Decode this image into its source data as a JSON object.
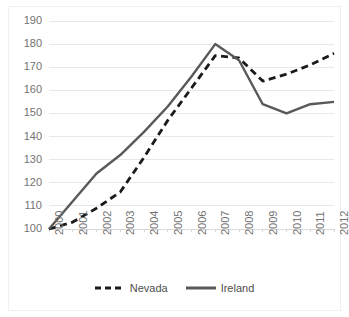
{
  "chart_data": {
    "type": "line",
    "title": "",
    "subtitle": "",
    "xlabel": "",
    "ylabel": "",
    "x": [
      2000,
      2001,
      2002,
      2003,
      2004,
      2005,
      2006,
      2007,
      2008,
      2009,
      2010,
      2011,
      2012
    ],
    "categories": [
      "2000",
      "2001",
      "2002",
      "2003",
      "2004",
      "2005",
      "2006",
      "2007",
      "2008",
      "2009",
      "2010",
      "2011",
      "2012"
    ],
    "series": [
      {
        "name": "Nevada",
        "style": "dashed",
        "color": "#1a1a1a",
        "values": [
          100,
          103,
          109,
          116,
          131,
          147,
          161,
          175,
          174,
          164,
          167,
          171,
          176
        ]
      },
      {
        "name": "Ireland",
        "style": "solid",
        "color": "#595959",
        "values": [
          100,
          112,
          124,
          132,
          142,
          153,
          166,
          180,
          173,
          154,
          150,
          154,
          155
        ]
      }
    ],
    "yticks": [
      100,
      110,
      120,
      130,
      140,
      150,
      160,
      170,
      180,
      190
    ],
    "ytick_labels": [
      "100",
      "110",
      "120",
      "130",
      "140",
      "150",
      "160",
      "170",
      "180",
      "190"
    ],
    "ylim": [
      100,
      190
    ],
    "xlim": [
      2000,
      2012
    ],
    "grid": "horizontal",
    "grid_color": "#e8e8e8",
    "legend_position": "bottom",
    "background_color": "#ffffff",
    "tick_label_color": "#737373"
  },
  "legend": {
    "items": [
      {
        "label": "Nevada"
      },
      {
        "label": "Ireland"
      }
    ]
  }
}
